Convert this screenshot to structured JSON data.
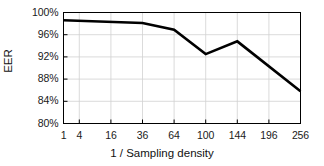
{
  "chart_data": {
    "type": "line",
    "title": "",
    "xlabel": "1 / Sampling density",
    "ylabel": "EER",
    "x": [
      1,
      4,
      16,
      36,
      64,
      100,
      144,
      196,
      256
    ],
    "xtick_labels": [
      "1",
      "4",
      "16",
      "36",
      "64",
      "100",
      "144",
      "196",
      "256"
    ],
    "ytick_labels": [
      "100%",
      "96%",
      "92%",
      "88%",
      "84%",
      "80%"
    ],
    "ytick_values": [
      100,
      96,
      92,
      88,
      84,
      80
    ],
    "ylim": [
      80,
      100
    ],
    "xlim": [
      1,
      256
    ],
    "xscale": "sqrt",
    "grid": true,
    "legend": false,
    "series": [
      {
        "name": "EER",
        "color": "#000000",
        "points": [
          {
            "x": 1,
            "y": 98.6
          },
          {
            "x": 36,
            "y": 98.1
          },
          {
            "x": 64,
            "y": 96.9
          },
          {
            "x": 100,
            "y": 92.5
          },
          {
            "x": 144,
            "y": 94.8
          },
          {
            "x": 256,
            "y": 85.8
          }
        ]
      }
    ]
  },
  "axis_titles": {
    "x": "1 / Sampling density",
    "y": "EER"
  }
}
